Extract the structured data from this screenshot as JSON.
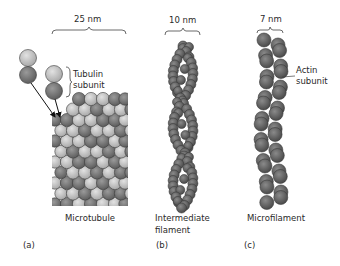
{
  "panels": [
    {
      "id": "a",
      "letter": "(a)",
      "name": "Microtubule",
      "width_label": "25 nm",
      "subunit_label_line1": "Tubulin",
      "subunit_label_line2": "subunit"
    },
    {
      "id": "b",
      "letter": "(b)",
      "name_line1": "Intermediate",
      "name_line2": "filament",
      "width_label": "10 nm"
    },
    {
      "id": "c",
      "letter": "(c)",
      "name": "Microfilament",
      "width_label": "7 nm",
      "subunit_label_line1": "Actin",
      "subunit_label_line2": "subunit"
    }
  ],
  "colors": {
    "tubulin_light": "#c8c8c8",
    "tubulin_dark": "#7a7a7a",
    "filament": "#6b6b6b",
    "outline": "#3a3a3a",
    "bracket": "#444444"
  }
}
